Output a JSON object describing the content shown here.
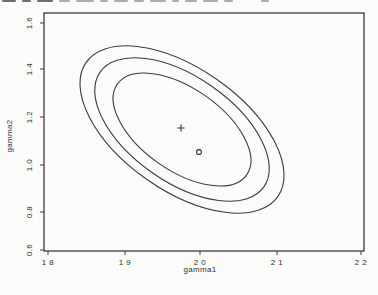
{
  "page": {
    "background": "#fcfcfa",
    "ink": "#3b3b3b",
    "label_ink": "#2e2e2e"
  },
  "chart_data": {
    "type": "contour",
    "title": "",
    "xlabel": "gamma1",
    "ylabel": "gamma2",
    "xlim": [
      1.8,
      2.2
    ],
    "ylim": [
      0.6,
      1.6
    ],
    "grid": false,
    "legend": "none",
    "xticks": [
      {
        "label": "1 8",
        "value": 1.8
      },
      {
        "label": "1 9",
        "value": 1.9
      },
      {
        "label": "2 0",
        "value": 2.0
      },
      {
        "label": "2 1",
        "value": 2.1
      },
      {
        "label": "2 2",
        "value": 2.2
      }
    ],
    "yticks": [
      {
        "label": "1.6",
        "value": 1.6
      },
      {
        "label": "1.4",
        "value": 1.4
      },
      {
        "label": "1.2",
        "value": 1.2
      },
      {
        "label": "1.0",
        "value": 1.0
      },
      {
        "label": "0.8",
        "value": 0.8
      },
      {
        "label": "0.6",
        "value": 0.6
      }
    ],
    "markers": [
      {
        "symbol": "+",
        "x": 1.97,
        "y": 1.13
      },
      {
        "symbol": "o",
        "x": 2.0,
        "y": 1.0
      }
    ],
    "contours": [
      {
        "name": "inner",
        "center": [
          1.97,
          1.13
        ],
        "x_extent": [
          1.88,
          2.06
        ],
        "y_extent": [
          0.88,
          1.38
        ]
      },
      {
        "name": "middle",
        "center": [
          1.97,
          1.13
        ],
        "x_extent": [
          1.86,
          2.08
        ],
        "y_extent": [
          0.81,
          1.45
        ]
      },
      {
        "name": "outer",
        "center": [
          1.97,
          1.13
        ],
        "x_extent": [
          1.84,
          2.1
        ],
        "y_extent": [
          0.76,
          1.5
        ]
      }
    ],
    "orientation": "ellipses tilted, major axis descending left-to-right (negative correlation)",
    "render": {
      "box": {
        "left": 44,
        "top": 13,
        "width": 320,
        "height": 238
      },
      "tick_len": 4,
      "xtick_px": [
        48,
        125,
        200,
        277,
        361
      ],
      "ytick_py": [
        23,
        69,
        117,
        165,
        212,
        250
      ],
      "xtick_label_y": 265,
      "ytick_label_x": 29,
      "ellipses": [
        {
          "cx": 182,
          "cy": 129.5,
          "rx": 117,
          "ry": 61,
          "angle": 35
        },
        {
          "cx": 182,
          "cy": 129.5,
          "rx": 100,
          "ry": 52.5,
          "angle": 35
        },
        {
          "cx": 182,
          "cy": 129.5,
          "rx": 79,
          "ry": 41,
          "angle": 35
        }
      ],
      "markers_px": [
        {
          "symbol": "+",
          "x": 181,
          "y": 128
        },
        {
          "symbol": "o",
          "x": 199,
          "y": 152
        }
      ]
    }
  }
}
